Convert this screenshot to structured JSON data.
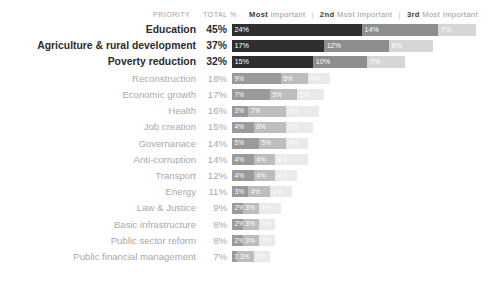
{
  "legend": {
    "priority_label": "PRIORITY",
    "total_label": "TOTAL %",
    "separator": "|",
    "items": [
      {
        "rank": "Most",
        "text": "important"
      },
      {
        "rank": "2nd",
        "text": "Most Important"
      },
      {
        "rank": "3rd",
        "text": "Most Important"
      }
    ]
  },
  "colors": {
    "series1": "#2f2f2f",
    "series2": "#8d8d8d",
    "series3": "#d6d6d6",
    "series1_dim": "#9a9a9a",
    "series2_dim": "#bdbdbd",
    "series3_dim": "#eaeaea",
    "label_top": "#2b2b2b",
    "label_dim": "#a9a9a9",
    "background": "#ffffff"
  },
  "chart_data": {
    "type": "bar",
    "title": "",
    "xlabel": "",
    "ylabel": "",
    "stacked": true,
    "orientation": "horizontal",
    "legend_position": "top",
    "grid": false,
    "xlim": [
      0,
      45
    ],
    "categories": [
      "Education",
      "Agriculture & rural development",
      "Poverty reduction",
      "Reconstruction",
      "Economic growth",
      "Health",
      "Job creation",
      "Governanace",
      "Anti-corruption",
      "Transport",
      "Energy",
      "Law & Justice",
      "Basic infrastructure",
      "Public sector reform",
      "Public financial management"
    ],
    "totals": [
      "45%",
      "37%",
      "32%",
      "18%",
      "17%",
      "16%",
      "15%",
      "14%",
      "14%",
      "12%",
      "11%",
      "9%",
      "8%",
      "8%",
      "7%"
    ],
    "series": [
      {
        "name": "Most important",
        "values": [
          24,
          17,
          15,
          9,
          7,
          3,
          4,
          5,
          4,
          4,
          3,
          2,
          2,
          2,
          1
        ],
        "labels": [
          "24%",
          "17%",
          "15%",
          "9%",
          "7%",
          "3%",
          "4%",
          "5%",
          "4%",
          "4%",
          "3%",
          "2%",
          "2%",
          "2%",
          "1%"
        ]
      },
      {
        "name": "2nd Most Important",
        "values": [
          14,
          12,
          10,
          5,
          5,
          7,
          6,
          5,
          4,
          4,
          4,
          3,
          3,
          3,
          3
        ],
        "labels": [
          "14%",
          "12%",
          "10%",
          "5%",
          "5%",
          "7%",
          "6%",
          "5%",
          "4%",
          "4%",
          "4%",
          "3%",
          "3%",
          "3%",
          "3%"
        ]
      },
      {
        "name": "3rd Most Important",
        "values": [
          7,
          8,
          7,
          4,
          5,
          6,
          5,
          4,
          6,
          4,
          4,
          4,
          3,
          3,
          3
        ],
        "labels": [
          "7%",
          "8%",
          "7%",
          "4%",
          "5%",
          "6%",
          "5%",
          "4%",
          "6%",
          "4%",
          "4%",
          "4%",
          "3%",
          "3%",
          "3%"
        ]
      }
    ],
    "emphasized_rows": 3
  }
}
